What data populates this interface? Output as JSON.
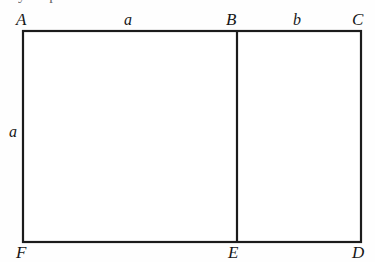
{
  "figure": {
    "type": "geometry-diagram",
    "shape": "rectangle-divided-into-two-rectangles",
    "stroke_color": "#1b1b1b",
    "background_color": "#fefefe",
    "clipped_text_above": "y   p",
    "vertices": [
      {
        "id": "A",
        "label": "A",
        "position": "top-left"
      },
      {
        "id": "B",
        "label": "B",
        "position": "top-middle"
      },
      {
        "id": "C",
        "label": "C",
        "position": "top-right"
      },
      {
        "id": "F",
        "label": "F",
        "position": "bottom-left"
      },
      {
        "id": "E",
        "label": "E",
        "position": "bottom-middle"
      },
      {
        "id": "D",
        "label": "D",
        "position": "bottom-right"
      }
    ],
    "side_labels": [
      {
        "id": "top-left-segment",
        "label": "a",
        "edge": "AB"
      },
      {
        "id": "top-right-segment",
        "label": "b",
        "edge": "BC"
      },
      {
        "id": "left-edge",
        "label": "a",
        "edge": "AF"
      }
    ]
  }
}
